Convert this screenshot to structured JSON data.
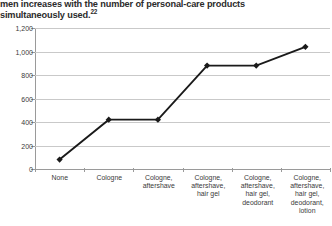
{
  "caption": {
    "line1": "men increases with the number of personal-care products",
    "line2": "simultaneously used.",
    "footnote_ref": "22"
  },
  "chart_data": {
    "type": "line",
    "title": "",
    "xlabel": "",
    "ylabel": "",
    "categories": [
      "None",
      "Cologne",
      "Cologne,\naftershave",
      "Cologne,\naftershave,\nhair gel",
      "Cologne,\naftershave,\nhair gel,\ndeodorant",
      "Cologne,\naftershave,\nhair gel,\ndeodorant,\nlotion"
    ],
    "values": [
      80,
      420,
      420,
      880,
      880,
      1040
    ],
    "ylim": [
      0,
      1200
    ],
    "yticks": [
      0,
      200,
      400,
      600,
      800,
      1000,
      1200
    ],
    "ytick_labels": [
      "0",
      "200",
      "400",
      "600",
      "800",
      "1,000",
      "1,200"
    ],
    "grid": true,
    "legend": "none",
    "marker": "diamond",
    "line_color": "#1a1a1a",
    "grid_color": "#c9c9c9",
    "axis_color": "#9a9a9a"
  }
}
